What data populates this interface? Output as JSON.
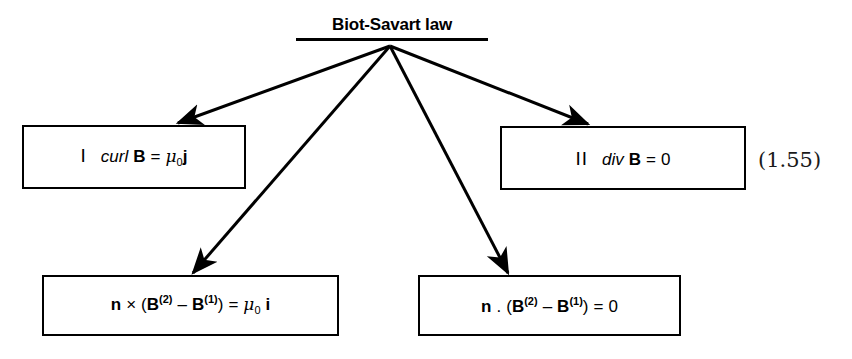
{
  "diagram": {
    "title": "Biot-Savart law",
    "equation_number": "(1.55)",
    "nodes": [
      {
        "id": "curl",
        "roman": "I",
        "operator": "curl",
        "field": "B",
        "equals": "=",
        "constant": "μ",
        "constant_sub": "0",
        "source": "j",
        "plain_text": "I  curl B = μ0 j"
      },
      {
        "id": "div",
        "roman": "II",
        "operator": "div",
        "field": "B",
        "equals": "=",
        "value": "0",
        "plain_text": "II  div B = 0"
      },
      {
        "id": "cross",
        "normal": "n",
        "product": "×",
        "open": "(",
        "field": "B",
        "sup2": "(2)",
        "minus": "–",
        "sup1": "(1)",
        "close": ")",
        "equals": "=",
        "constant": "μ",
        "constant_sub": "0",
        "source": "i",
        "plain_text": "n × (B(2) – B(1)) = μ0 i"
      },
      {
        "id": "dot",
        "normal": "n",
        "product": ".",
        "open": "(",
        "field": "B",
        "sup2": "(2)",
        "minus": "–",
        "sup1": "(1)",
        "close": ")",
        "equals": "=",
        "value": "0",
        "plain_text": "n . (B(2) – B(1)) = 0"
      }
    ],
    "arrows": [
      {
        "id": "arrow-to-curl",
        "from": [
          390,
          46
        ],
        "to": [
          178,
          123
        ]
      },
      {
        "id": "arrow-to-cross",
        "from": [
          390,
          46
        ],
        "to": [
          193,
          273
        ]
      },
      {
        "id": "arrow-to-dot",
        "from": [
          390,
          46
        ],
        "to": [
          508,
          273
        ]
      },
      {
        "id": "arrow-to-div",
        "from": [
          390,
          46
        ],
        "to": [
          588,
          124
        ]
      }
    ],
    "colors": {
      "ink": "#000000",
      "background": "#ffffff",
      "equation_number_ink": "#1a1a1a"
    }
  }
}
